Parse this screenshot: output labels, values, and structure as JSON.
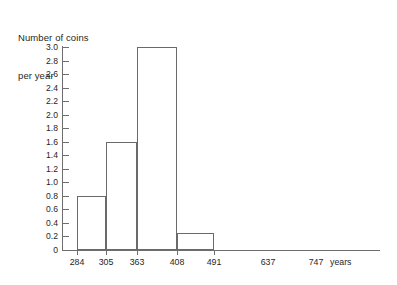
{
  "chart_data": {
    "type": "bar",
    "title": "Number of coins per year",
    "title_lines": [
      "Number of coins",
      "per year"
    ],
    "xlabel": "years",
    "ylabel": "Number of coins per year",
    "categories": [
      "284-305",
      "305-363",
      "363-408",
      "408-491"
    ],
    "values": [
      0.8,
      1.6,
      3.0,
      0.25
    ],
    "bin_edges": [
      284,
      305,
      363,
      408,
      491
    ],
    "x_tick_labels": [
      "284",
      "305",
      "363",
      "408",
      "491",
      "637",
      "747"
    ],
    "x_tick_marked": [
      284,
      305,
      363,
      408,
      491
    ],
    "ylim": [
      0,
      3.0
    ],
    "y_tick_step": 0.2,
    "y_tick_labels": [
      "3.0",
      "2.8",
      "2.6",
      "2.4",
      "2.2",
      "2.0",
      "1.8",
      "1.6",
      "1.4",
      "1.2",
      "1.0",
      "0.8",
      "0.6",
      "0.4",
      "0.2",
      "0"
    ],
    "y_tick_values": [
      3.0,
      2.8,
      2.6,
      2.4,
      2.2,
      2.0,
      1.8,
      1.6,
      1.4,
      1.2,
      1.0,
      0.8,
      0.6,
      0.4,
      0.2,
      0
    ],
    "grid": false,
    "legend": null,
    "bar_fill": "#ffffff",
    "bar_stroke": "#6a6a6a",
    "axis_color": "#6e6e6e",
    "background": "#ffffff"
  }
}
